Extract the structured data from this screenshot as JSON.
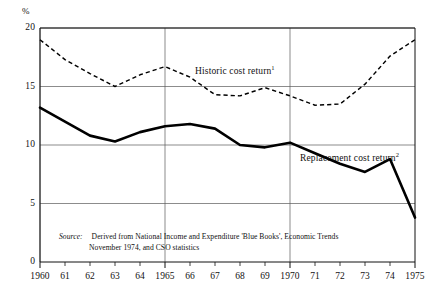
{
  "chart_data": {
    "type": "line",
    "title": "",
    "subtitle": "",
    "xlabel": "",
    "ylabel": "%",
    "xlim": [
      1960,
      1975
    ],
    "ylim": [
      0,
      20
    ],
    "yticks": [
      0,
      5,
      10,
      15,
      20
    ],
    "ytick_labels": [
      "0",
      "5",
      "10",
      "15",
      "20"
    ],
    "x": [
      1960,
      1961,
      1962,
      1963,
      1964,
      1965,
      1966,
      1967,
      1968,
      1969,
      1970,
      1971,
      1972,
      1973,
      1974,
      1975
    ],
    "xtick_labels": [
      "1960",
      "61",
      "62",
      "63",
      "64",
      "1965",
      "66",
      "67",
      "68",
      "69",
      "1970",
      "71",
      "72",
      "73",
      "74",
      "1975"
    ],
    "grid": "major-x-at-1960-1965-1970-1975-and-y-at-5-10-15-20",
    "legend_position": "inline-annotations",
    "series": [
      {
        "name": "Historic cost return",
        "footnote": "1",
        "style": "dashed",
        "color": "#000000",
        "values": [
          19.0,
          17.4,
          16.2,
          15.0,
          16.0,
          16.7,
          15.6,
          14.3,
          14.2,
          14.9,
          14.3,
          13.4,
          13.7,
          15.2,
          17.4,
          19.0
        ]
      },
      {
        "name": "Replacement cost return",
        "footnote": "2",
        "style": "solid",
        "color": "#000000",
        "values": [
          13.2,
          12.0,
          10.9,
          10.3,
          11.1,
          11.7,
          11.8,
          11.2,
          10.0,
          9.8,
          10.2,
          9.8,
          9.0,
          8.6,
          7.0,
          5.0
        ]
      }
    ],
    "series_overrides": {
      "historic_points": [
        [
          1960,
          19.0
        ],
        [
          1961,
          17.3
        ],
        [
          1962,
          16.1
        ],
        [
          1963,
          15.0
        ],
        [
          1964,
          16.0
        ],
        [
          1965,
          16.7
        ],
        [
          1966,
          15.8
        ],
        [
          1967,
          14.3
        ],
        [
          1968,
          14.2
        ],
        [
          1969,
          14.9
        ],
        [
          1970,
          14.2
        ],
        [
          1971,
          13.4
        ],
        [
          1972,
          13.5
        ],
        [
          1973,
          15.2
        ],
        [
          1974,
          17.6
        ],
        [
          1975,
          19.0
        ]
      ],
      "replacement_points": [
        [
          1960,
          13.2
        ],
        [
          1961,
          12.0
        ],
        [
          1962,
          10.8
        ],
        [
          1963,
          10.3
        ],
        [
          1964,
          11.1
        ],
        [
          1965,
          11.6
        ],
        [
          1966,
          11.8
        ],
        [
          1967,
          11.4
        ],
        [
          1968,
          10.0
        ],
        [
          1969,
          9.8
        ],
        [
          1970,
          10.2
        ],
        [
          1971,
          9.3
        ],
        [
          1972,
          8.4
        ],
        [
          1973,
          7.7
        ],
        [
          1974,
          8.8
        ],
        [
          1975,
          3.8
        ]
      ]
    },
    "annotations": [
      {
        "text": "Historic cost return",
        "footnote": "1",
        "x": 1966.2,
        "y": 16.3
      },
      {
        "text": "Replacement cost return",
        "footnote": "2",
        "x": 1970.4,
        "y": 8.9
      }
    ]
  },
  "axis": {
    "y_unit_label": "%"
  },
  "source": {
    "label": "Source:",
    "line1": "Derived from National Income and Expenditure 'Blue Books', Economic Trends",
    "line2": "November 1974, and CSO statistics"
  }
}
